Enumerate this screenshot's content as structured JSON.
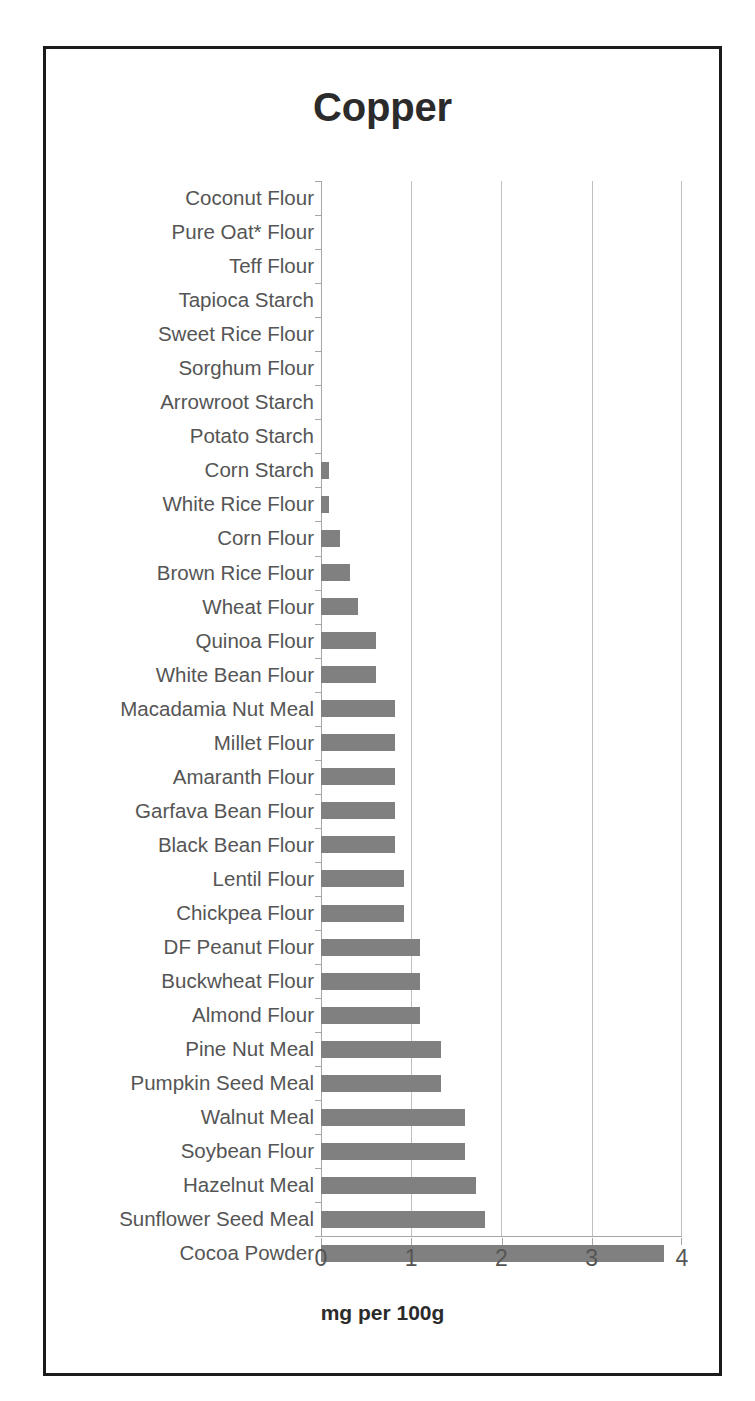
{
  "chart_data": {
    "type": "bar",
    "orientation": "horizontal",
    "title": "Copper",
    "xlabel": "mg per 100g",
    "ylabel": "",
    "xlim": [
      0,
      4
    ],
    "xticks": [
      "0",
      "1",
      "2",
      "3",
      "4"
    ],
    "grid": "vertical",
    "legend": "none",
    "bar_color": "#808080",
    "categories": [
      "Coconut Flour",
      "Pure Oat* Flour",
      "Teff Flour",
      "Tapioca Starch",
      "Sweet Rice Flour",
      "Sorghum Flour",
      "Arrowroot Starch",
      "Potato Starch",
      "Corn Starch",
      "White Rice Flour",
      "Corn Flour",
      "Brown Rice Flour",
      "Wheat Flour",
      "Quinoa Flour",
      "White Bean Flour",
      "Macadamia Nut Meal",
      "Millet Flour",
      "Amaranth Flour",
      "Garfava Bean Flour",
      "Black Bean Flour",
      "Lentil Flour",
      "Chickpea Flour",
      "DF Peanut Flour",
      "Buckwheat Flour",
      "Almond Flour",
      "Pine Nut Meal",
      "Pumpkin Seed Meal",
      "Walnut Meal",
      "Soybean Flour",
      "Hazelnut Meal",
      "Sunflower Seed Meal",
      "Cocoa Powder"
    ],
    "values": [
      0,
      0,
      0,
      0,
      0,
      0,
      0,
      0,
      0.09,
      0.09,
      0.21,
      0.32,
      0.41,
      0.61,
      0.61,
      0.82,
      0.82,
      0.82,
      0.82,
      0.82,
      0.92,
      0.92,
      1.1,
      1.1,
      1.1,
      1.33,
      1.33,
      1.6,
      1.6,
      1.72,
      1.82,
      3.8
    ]
  }
}
